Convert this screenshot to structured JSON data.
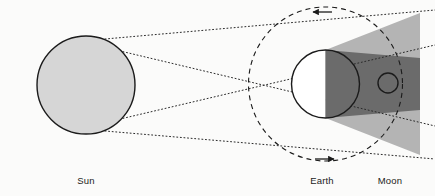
{
  "diagram": {
    "type": "astronomy-lunar-eclipse",
    "background_color": "#fbfbfa",
    "canvas": {
      "width": 435,
      "height": 196
    }
  },
  "labels": {
    "sun": "Sun",
    "earth": "Earth",
    "moon": "Moon"
  },
  "label_positions": {
    "sun": {
      "x": 86,
      "y": 176
    },
    "earth": {
      "x": 322,
      "y": 176
    },
    "moon": {
      "x": 390,
      "y": 176
    }
  },
  "bodies": {
    "sun": {
      "name": "Sun",
      "center_x": 86,
      "center_y": 85,
      "radius": 49,
      "fill": "#d6d6d6",
      "stroke": "#1b1b1b",
      "stroke_width": 1.4
    },
    "earth": {
      "name": "Earth",
      "center_x": 325.5,
      "center_y": 84,
      "radius": 34,
      "fill_lit": "#ffffff",
      "fill_dark": "#6b6b6b",
      "stroke": "#1b1b1b",
      "stroke_width": 1.4,
      "terminator_x": 325.5
    },
    "moon": {
      "name": "Moon",
      "center_x": 388,
      "center_y": 83,
      "radius": 10,
      "fill": "none",
      "stroke": "#1b1b1b",
      "stroke_width": 1.4
    }
  },
  "orbit": {
    "name": "Moon orbit",
    "center_x": 325.5,
    "center_y": 84,
    "radius": 77,
    "stroke": "#1b1b1b",
    "stroke_width": 1.1,
    "dash": "5,4"
  },
  "shadow": {
    "penumbra": {
      "name": "penumbra",
      "fill": "#b4b4b4",
      "points": "325.5,50 420,13 420,155 325.5,118"
    },
    "umbra": {
      "name": "umbra",
      "fill": "#6b6b6b",
      "points": "325.5,50 420,58 420,110 325.5,118"
    }
  },
  "rays": {
    "stroke": "#2a2a2a",
    "stroke_width": 1,
    "dash": "1,2.6",
    "lines": [
      {
        "name": "outer-ray-top",
        "x1": 105,
        "y1": 39,
        "x2": 435,
        "y2": 10
      },
      {
        "name": "outer-ray-bottom",
        "x1": 105,
        "y1": 131,
        "x2": 435,
        "y2": 159
      },
      {
        "name": "inner-ray-top-crossing",
        "x1": 116,
        "y1": 50,
        "x2": 435,
        "y2": 126
      },
      {
        "name": "inner-ray-bottom-crossing",
        "x1": 116,
        "y1": 120,
        "x2": 435,
        "y2": 45
      }
    ]
  },
  "arrows": {
    "stroke": "#1b1b1b",
    "top": {
      "name": "orbit-direction-arrow-top",
      "direction": "left",
      "x_start": 332,
      "x_end": 313,
      "y": 12
    },
    "bottom": {
      "name": "orbit-direction-arrow-bottom",
      "direction": "right",
      "x_start": 315,
      "x_end": 334,
      "y": 159
    }
  }
}
